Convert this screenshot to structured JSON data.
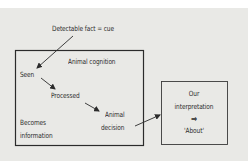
{
  "diagram": {
    "cue_label": "Detectable fact = cue",
    "cognition_box": {
      "title": "Animal cognition",
      "steps": [
        "Seen",
        "Processed",
        "Animal decision"
      ],
      "step_seen": "Seen",
      "step_processed": "Processed",
      "step_decision_line1": "Animal",
      "step_decision_line2": "decision",
      "becomes_line1": "Becomes",
      "becomes_line2": "information"
    },
    "interpretation_box": {
      "line1": "Our",
      "line2": "interpretation",
      "arrow_symbol": "⇒",
      "line3": "'About'"
    },
    "colors": {
      "background": "#e9e9e6",
      "stroke": "#2b2b2b"
    }
  }
}
